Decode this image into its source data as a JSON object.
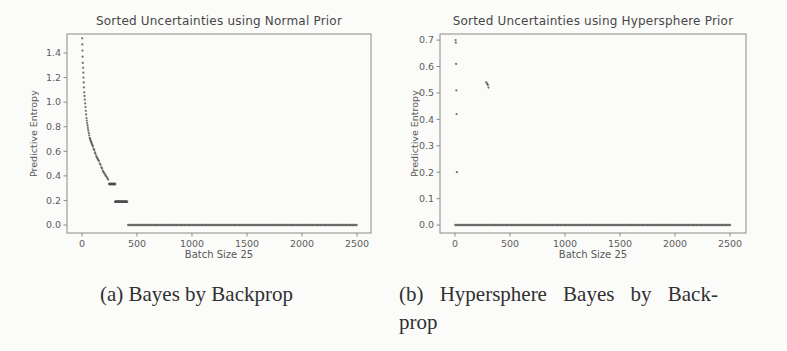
{
  "captions": {
    "a": "(a) Bayes by Backprop",
    "b_line1": "(b) Hypersphere Bayes by Back-",
    "b_line2": "prop"
  },
  "colors": {
    "axis": "#8a8a8a",
    "tick_text": "#5d5d5d",
    "title_text": "#474747",
    "dot": "#4e4e4e",
    "caption_text": "#303030",
    "page_background": "#fbfbf9"
  },
  "chart_data": [
    {
      "type": "scatter",
      "title": "Sorted Uncertainties using Normal Prior",
      "xlabel": "Batch Size 25",
      "ylabel": "Predictive Entropy",
      "xlim": [
        -136,
        2627
      ],
      "ylim": [
        -0.065,
        1.555
      ],
      "xticks": [
        0,
        500,
        1000,
        1500,
        2000,
        2500
      ],
      "yticks": [
        0.0,
        0.2,
        0.4,
        0.6,
        0.8,
        1.0,
        1.2,
        1.4
      ],
      "grid": false,
      "legend": null,
      "points": [
        [
          2,
          1.52
        ],
        [
          3,
          1.47
        ],
        [
          4,
          1.42
        ],
        [
          6,
          1.37
        ],
        [
          8,
          1.32
        ],
        [
          10,
          1.28
        ],
        [
          12,
          1.24
        ],
        [
          14,
          1.2
        ],
        [
          16,
          1.16
        ],
        [
          18,
          1.12
        ],
        [
          20,
          1.08
        ],
        [
          23,
          1.05
        ],
        [
          26,
          1.02
        ],
        [
          29,
          0.99
        ],
        [
          32,
          0.96
        ],
        [
          35,
          0.93
        ],
        [
          38,
          0.9
        ],
        [
          41,
          0.87
        ],
        [
          44,
          0.85
        ],
        [
          47,
          0.83
        ],
        [
          50,
          0.81
        ],
        [
          54,
          0.79
        ],
        [
          58,
          0.77
        ],
        [
          62,
          0.75
        ],
        [
          66,
          0.73
        ],
        [
          70,
          0.71
        ],
        [
          74,
          0.7
        ],
        [
          78,
          0.69
        ],
        [
          82,
          0.68
        ],
        [
          86,
          0.67
        ],
        [
          90,
          0.66
        ],
        [
          95,
          0.65
        ],
        [
          100,
          0.64
        ],
        [
          106,
          0.62
        ],
        [
          112,
          0.61
        ],
        [
          118,
          0.59
        ],
        [
          124,
          0.58
        ],
        [
          130,
          0.56
        ],
        [
          136,
          0.55
        ],
        [
          142,
          0.54
        ],
        [
          148,
          0.53
        ],
        [
          155,
          0.52
        ],
        [
          162,
          0.5
        ],
        [
          169,
          0.49
        ],
        [
          176,
          0.47
        ],
        [
          183,
          0.46
        ],
        [
          190,
          0.44
        ],
        [
          197,
          0.43
        ],
        [
          204,
          0.42
        ],
        [
          211,
          0.41
        ],
        [
          218,
          0.4
        ],
        [
          225,
          0.39
        ],
        [
          232,
          0.38
        ],
        [
          238,
          0.37
        ]
      ],
      "runs": [
        {
          "x_from": 248,
          "x_to": 302,
          "y": 0.335,
          "x_step": 3
        },
        {
          "x_from": 302,
          "x_to": 412,
          "y": 0.19,
          "x_step": 3
        },
        {
          "x_from": 420,
          "x_to": 2500,
          "y": 0.0,
          "x_step": 12
        }
      ]
    },
    {
      "type": "scatter",
      "title": "Sorted Uncertainties using Hypersphere Prior",
      "xlabel": "Batch Size 25",
      "ylabel": "Predictive Entropy",
      "xlim": [
        -136,
        2645
      ],
      "ylim": [
        -0.03,
        0.723
      ],
      "xticks": [
        0,
        500,
        1000,
        1500,
        2000,
        2500
      ],
      "yticks": [
        0.0,
        0.1,
        0.2,
        0.3,
        0.4,
        0.5,
        0.6,
        0.7
      ],
      "grid": false,
      "legend": null,
      "points": [
        [
          6,
          0.7
        ],
        [
          8,
          0.69
        ],
        [
          10,
          0.61
        ],
        [
          12,
          0.51
        ],
        [
          15,
          0.42
        ],
        [
          18,
          0.2
        ],
        [
          285,
          0.54
        ],
        [
          292,
          0.535
        ],
        [
          298,
          0.53
        ],
        [
          305,
          0.52
        ]
      ],
      "runs": [
        {
          "x_from": 4,
          "x_to": 2500,
          "y": 0.0,
          "x_step": 12
        }
      ]
    }
  ]
}
